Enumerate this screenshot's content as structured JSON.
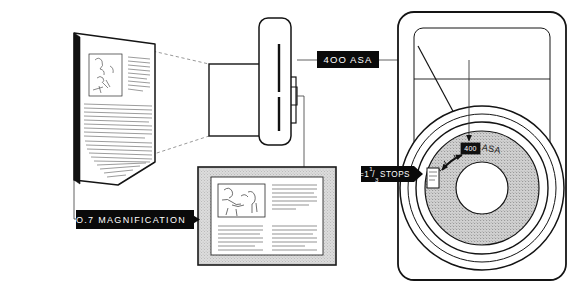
{
  "diagram": {
    "background_color": "#ffffff",
    "ink_color": "#1a1a1a",
    "label_bg_color": "#0a0a0a",
    "label_text_color": "#ffffff",
    "dial_fill_color": "#d8d8d8",
    "mat_fill_color": "#d2d2d2"
  },
  "labels": {
    "film_speed": {
      "text": "4OO ASA",
      "name": "400-asa-callout"
    },
    "exposure_compensation": {
      "prefix": "=",
      "whole": "1",
      "numerator": "1",
      "denominator": "3",
      "unit": "STOPS",
      "full_text": "= 1 1/3 STOPS"
    },
    "magnification": {
      "value": "O.7",
      "caption": "MAGNIFICATION",
      "full_text": "0.7 MAGNIFICATION"
    },
    "dial_reading": {
      "highlighted_value": "400",
      "unit": "ASA",
      "full_text": "400 ASA"
    }
  },
  "objects": {
    "subject_page": "original-document-page",
    "lens_assembly": "extension-bellows-lens",
    "camera_back": "camera-body-rear",
    "film_speed_dial": "asa-film-speed-dial",
    "result_print": "magnified-result-print"
  },
  "arrows": {
    "magnification_arrow": "right-pointing",
    "dial_arrow": "down-pointing",
    "compensation_arrow": "double-headed-arc"
  }
}
